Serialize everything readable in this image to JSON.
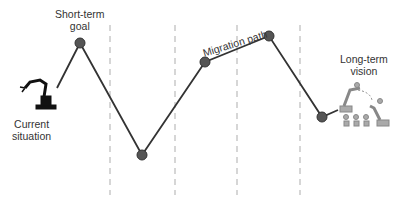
{
  "diagram": {
    "labels": {
      "current": [
        "Current",
        "situation"
      ],
      "short_term": [
        "Short-term",
        "goal"
      ],
      "migration": "Migration path",
      "long_term": [
        "Long-term",
        "vision"
      ]
    },
    "colors": {
      "line": "#333333",
      "node": "#555555",
      "dashes": "#bbbbbb",
      "text": "#333333"
    },
    "dividers_x": [
      110,
      175,
      237,
      300
    ],
    "path_points": [
      [
        57,
        88
      ],
      [
        80,
        43
      ],
      [
        142,
        155
      ],
      [
        205,
        62
      ],
      [
        269,
        36
      ],
      [
        322,
        117
      ],
      [
        338,
        110
      ]
    ],
    "nodes": [
      [
        80,
        43
      ],
      [
        142,
        155
      ],
      [
        205,
        62
      ],
      [
        269,
        36
      ],
      [
        322,
        117
      ]
    ]
  }
}
